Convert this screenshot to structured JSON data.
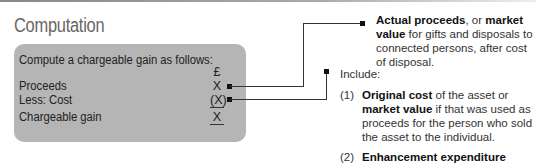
{
  "title": "Computation",
  "box": {
    "intro": "Compute a chargeable gain as follows:",
    "currency": "£",
    "rows": [
      {
        "label": "Proceeds",
        "value": "X"
      },
      {
        "label": "Less: Cost",
        "value": "(X)"
      },
      {
        "label": "Chargeable gain",
        "value": "X"
      }
    ]
  },
  "proceeds_note": {
    "bold1": "Actual proceeds",
    "text1": ", or ",
    "bold2": "market value",
    "text2": " for gifts and disposals to connected persons, after cost of disposal."
  },
  "cost_note": {
    "heading": "Include:",
    "items": [
      {
        "num": "(1)",
        "bold1": "Original cost",
        "text1": " of the asset or ",
        "bold2": "market value",
        "text2": " if that was used as proceeds for the person who sold the asset to the individual."
      },
      {
        "num": "(2)",
        "bold1": "Enhancement expenditure",
        "text1": " which was reflected in the state and nature of the",
        "bold2": "",
        "text2": ""
      }
    ]
  }
}
